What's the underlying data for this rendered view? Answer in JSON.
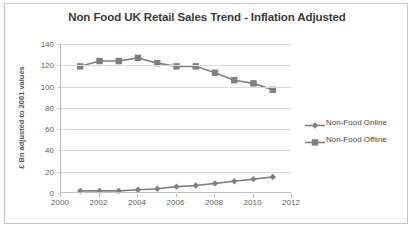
{
  "chart_data": {
    "type": "line",
    "title": "Non Food UK Retail Sales Trend - Inflation Adjusted",
    "xlabel": "",
    "ylabel": "£ Bn adjusted to 2001 values",
    "x": [
      2001,
      2002,
      2003,
      2004,
      2005,
      2006,
      2007,
      2008,
      2009,
      2010,
      2011
    ],
    "xlim": [
      2000,
      2012
    ],
    "ylim": [
      0,
      140
    ],
    "xticks": [
      2000,
      2002,
      2004,
      2006,
      2008,
      2010,
      2012
    ],
    "yticks": [
      0,
      20,
      40,
      60,
      80,
      100,
      120,
      140
    ],
    "grid": true,
    "legend_position": "right",
    "series": [
      {
        "name": "Non-Food Online",
        "marker": "diamond",
        "color": "#808080",
        "values": [
          2,
          2,
          2,
          3,
          4,
          6,
          7,
          9,
          11,
          13,
          15
        ]
      },
      {
        "name": "Non-Food Offline",
        "marker": "square",
        "color": "#7f7f7f",
        "values": [
          119,
          124,
          124,
          127,
          122,
          119,
          119,
          113,
          106,
          103,
          97
        ]
      }
    ]
  },
  "legend": {
    "entries": [
      {
        "label": "Non-Food Online"
      },
      {
        "label": "Non-Food Offline"
      }
    ]
  },
  "colors": {
    "title_text": "#3a3a3a",
    "axis_text": "#5f5f5f",
    "gridline": "#d9d9d9",
    "axis_line": "#bfbfbf",
    "frame_border": "#c8c8c8",
    "series_gray": "#808080",
    "background": "#ffffff"
  }
}
